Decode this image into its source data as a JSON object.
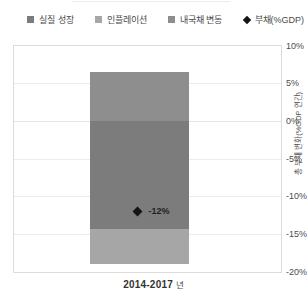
{
  "chart_data": {
    "type": "bar",
    "stacked": true,
    "categories": [
      "2014-2017 년"
    ],
    "series": [
      {
        "name": "실질 성장",
        "values": [
          -14.3
        ],
        "color": "#7c7c7c"
      },
      {
        "name": "인플레이션",
        "values": [
          -4.7
        ],
        "color": "#a6a6a6"
      },
      {
        "name": "내국채 변동",
        "values": [
          6.5
        ],
        "color": "#8e8e8e"
      }
    ],
    "marker_series": {
      "name": "부채(%GDP)",
      "values": [
        -12
      ],
      "color": "#141414",
      "data_label": "-12%"
    },
    "xlabel": "2014-2017 년",
    "xlabel_bold": "2014-2017",
    "xlabel_suffix": "년",
    "ylabel": "총 부채 변화(%GDP 연간)",
    "ylim": [
      -20,
      10
    ],
    "yticks": [
      10,
      5,
      0,
      -5,
      -10,
      -15,
      -20
    ],
    "ytick_labels": [
      "10%",
      "5%",
      "0%",
      "-5%",
      "-10%",
      "-15%",
      "-20%"
    ],
    "grid": true,
    "legend_position": "top"
  }
}
